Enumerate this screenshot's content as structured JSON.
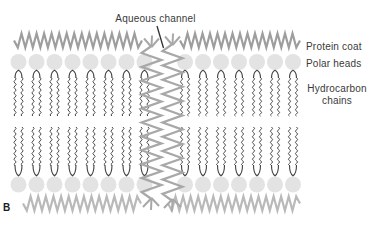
{
  "figure": {
    "panel_label": "B"
  },
  "labels": {
    "aqueous_channel": "Aqueous channel",
    "protein_coat": "Protein coat",
    "polar_heads": "Polar heads",
    "hydrocarbon_line1": "Hydrocarbon",
    "hydrocarbon_line2": "chains"
  },
  "colors": {
    "background": "#ffffff",
    "protein_coat_top": "#9e9e9e",
    "protein_coat_bottom": "#b9b9b9",
    "channel_wall": "#a8a8a8",
    "polar_head_fill": "#e3e3e3",
    "chain_stroke": "#404040",
    "pointer_line": "#2f2f2f",
    "label_text": "#3a3a3a",
    "panel_text": "#1c1c1c"
  },
  "structure": {
    "left_lipids_per_row": 8,
    "right_lipids_per_row": 7,
    "leaflet_rows": 2,
    "icon_legend": [
      {
        "icon": "zigzag-line-icon",
        "meaning": "protein coat"
      },
      {
        "icon": "circle-icon",
        "meaning": "polar head"
      },
      {
        "icon": "wavy-line-icon",
        "meaning": "hydrocarbon chain"
      },
      {
        "icon": "vertical-zigzag-icon",
        "meaning": "aqueous channel wall"
      }
    ]
  }
}
